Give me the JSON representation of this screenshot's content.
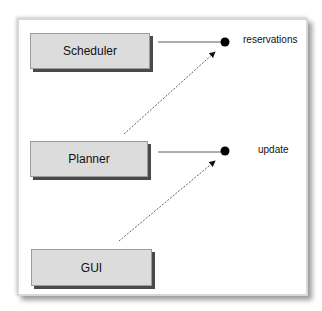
{
  "diagram": {
    "components": [
      {
        "id": "scheduler",
        "label": "Scheduler"
      },
      {
        "id": "planner",
        "label": "Planner"
      },
      {
        "id": "gui",
        "label": "GUI"
      }
    ],
    "interfaces": [
      {
        "id": "reservations",
        "label": "reservations",
        "provided_by": "scheduler",
        "required_by": "planner"
      },
      {
        "id": "update",
        "label": "update",
        "provided_by": "planner",
        "required_by": "gui"
      }
    ]
  }
}
